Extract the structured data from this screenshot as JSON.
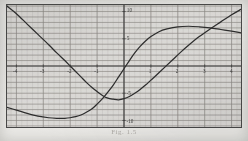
{
  "figure": {
    "caption": "Fig. 1.5",
    "background_color": "#f2f1ee",
    "plot_background_color": "#eeedea",
    "frame_color": "#4a4a4a",
    "grid_minor_color": "#b9b7b2",
    "grid_major_color": "#8d8b86",
    "axis_color": "#3f3f3f",
    "curve_color": "#2e2e2e"
  },
  "chart_data": {
    "type": "line",
    "title": "",
    "xlabel": "",
    "ylabel": "",
    "xlim": [
      -4.35,
      4.35
    ],
    "ylim": [
      -11.2,
      11.2
    ],
    "grid": true,
    "grid_minor_step": 0.2,
    "grid_major_step": 1.0,
    "legend": "none",
    "xticks": [
      -4,
      -3,
      -2,
      -1,
      1,
      2,
      3,
      4
    ],
    "xtick_labels": [
      "-4",
      "-3",
      "-2",
      "-1",
      "1",
      "2",
      "3",
      "4"
    ],
    "yticks": [
      10,
      5,
      -5,
      -10
    ],
    "ytick_labels": [
      "10",
      "5",
      "-5",
      "-10"
    ],
    "series": [
      {
        "name": "curve-a",
        "description": "descending-then-rising cubic crossing x-axis near -2.5",
        "x": [
          -4.35,
          -4.0,
          -3.6,
          -3.2,
          -2.8,
          -2.5,
          -2.2,
          -2.0,
          -1.8,
          -1.6,
          -1.4,
          -1.2,
          -1.0,
          -0.8,
          -0.6,
          -0.4,
          -0.2,
          0.0,
          0.2,
          0.4,
          0.6,
          0.8,
          1.0,
          1.2,
          1.5,
          1.8,
          2.1,
          2.4,
          2.8,
          3.2,
          3.6,
          4.0,
          4.35
        ],
        "y": [
          11.0,
          9.6,
          7.7,
          5.8,
          3.9,
          2.4,
          1.0,
          0.0,
          -1.0,
          -2.0,
          -3.0,
          -3.9,
          -4.7,
          -5.4,
          -5.9,
          -6.1,
          -6.2,
          -6.0,
          -5.6,
          -5.0,
          -4.3,
          -3.5,
          -2.6,
          -1.7,
          -0.3,
          1.1,
          2.5,
          3.8,
          5.4,
          6.8,
          8.1,
          9.4,
          10.4
        ]
      },
      {
        "name": "curve-b",
        "description": "flat-bottom curve rising to a plateau near y = 7",
        "x": [
          -4.35,
          -4.0,
          -3.6,
          -3.2,
          -2.8,
          -2.5,
          -2.2,
          -2.0,
          -1.8,
          -1.6,
          -1.4,
          -1.2,
          -1.0,
          -0.8,
          -0.6,
          -0.4,
          -0.2,
          0.0,
          0.2,
          0.4,
          0.6,
          0.8,
          1.0,
          1.3,
          1.6,
          2.0,
          2.4,
          2.8,
          3.2,
          3.6,
          4.0,
          4.35
        ],
        "y": [
          -7.6,
          -8.1,
          -8.7,
          -9.2,
          -9.5,
          -9.6,
          -9.6,
          -9.5,
          -9.3,
          -9.0,
          -8.5,
          -7.9,
          -7.0,
          -6.0,
          -4.8,
          -3.5,
          -2.0,
          -0.5,
          1.0,
          2.4,
          3.6,
          4.6,
          5.4,
          6.3,
          6.8,
          7.2,
          7.3,
          7.2,
          7.0,
          6.7,
          6.4,
          6.1
        ]
      }
    ]
  }
}
